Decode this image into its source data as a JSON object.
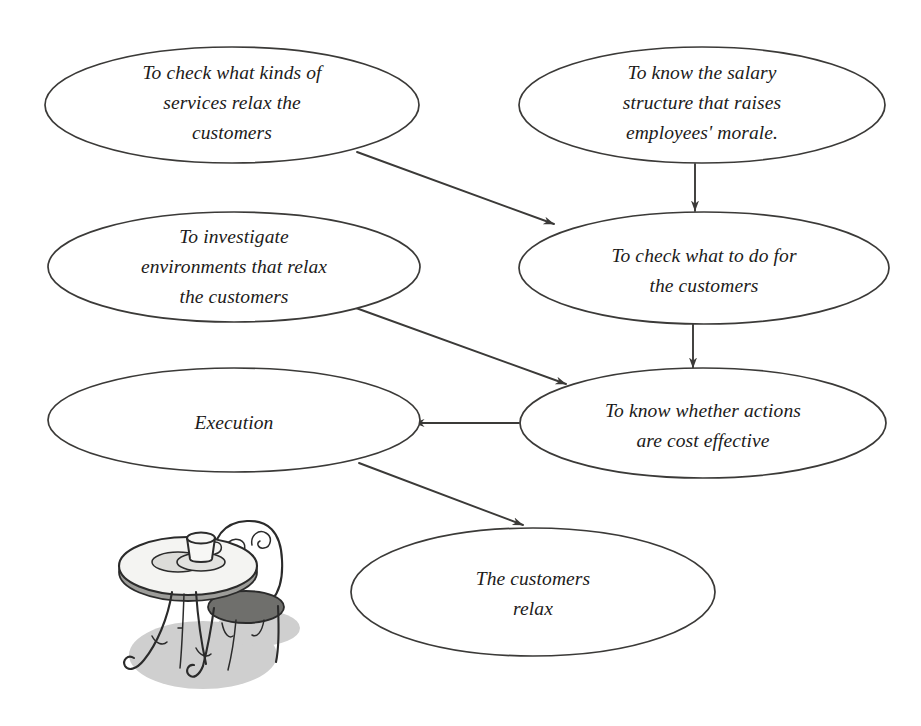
{
  "diagram": {
    "line_color": "#3b3a38",
    "node_fill": "#ffffff",
    "background": "#ffffff",
    "nodes": [
      {
        "id": "services",
        "label": "To check what kinds of services relax the customers",
        "lines": [
          "To check what kinds of",
          "services relax the",
          "customers"
        ],
        "cx": 232,
        "cy": 105,
        "rx": 187,
        "ry": 58
      },
      {
        "id": "salary",
        "label": "To know the salary structure that raises employees' morale.",
        "lines": [
          "To know the salary",
          "structure that raises",
          "employees' morale."
        ],
        "cx": 702,
        "cy": 105,
        "rx": 183,
        "ry": 58
      },
      {
        "id": "environments",
        "label": "To investigate environments that relax the customers",
        "lines": [
          "To investigate",
          "environments that relax",
          "the customers"
        ],
        "cx": 234,
        "cy": 267,
        "rx": 186,
        "ry": 55
      },
      {
        "id": "what-to-do",
        "label": "To check what to do for the customers",
        "lines": [
          "To check what to do for",
          "the customers"
        ],
        "cx": 704,
        "cy": 268,
        "rx": 185,
        "ry": 56
      },
      {
        "id": "execution",
        "label": "Execution",
        "lines": [
          "Execution"
        ],
        "cx": 234,
        "cy": 420,
        "rx": 186,
        "ry": 52
      },
      {
        "id": "cost-effective",
        "label": "To know whether actions are cost effective",
        "lines": [
          "To know whether actions",
          "are cost effective"
        ],
        "cx": 703,
        "cy": 423,
        "rx": 183,
        "ry": 55
      },
      {
        "id": "customers-relax",
        "label": "The customers relax",
        "lines": [
          "The customers",
          "relax"
        ],
        "cx": 533,
        "cy": 592,
        "rx": 182,
        "ry": 64
      }
    ],
    "edges": [
      {
        "id": "services-to-what-to-do",
        "from": "services",
        "to": "what-to-do",
        "x1": 357,
        "y1": 152,
        "x2": 554,
        "y2": 224
      },
      {
        "id": "salary-to-what-to-do",
        "from": "salary",
        "to": "what-to-do",
        "x1": 695,
        "y1": 164,
        "x2": 695,
        "y2": 211
      },
      {
        "id": "environments-to-cost-effective",
        "from": "environments",
        "to": "cost-effective",
        "x1": 356,
        "y1": 308,
        "x2": 566,
        "y2": 384
      },
      {
        "id": "what-to-do-to-cost-effective",
        "from": "what-to-do",
        "to": "cost-effective",
        "x1": 693,
        "y1": 324,
        "x2": 693,
        "y2": 368
      },
      {
        "id": "cost-effective-to-execution",
        "from": "cost-effective",
        "to": "execution",
        "x1": 519,
        "y1": 423,
        "x2": 414,
        "y2": 423
      },
      {
        "id": "execution-to-customers-relax",
        "from": "execution",
        "to": "customers-relax",
        "x1": 359,
        "y1": 463,
        "x2": 523,
        "y2": 525
      }
    ]
  },
  "illustration": {
    "name": "cafe-table-illustration",
    "description": "Round bistro table with coffee cup and saucer beside an ornate wrought-iron chair",
    "shadow_color": "#cfcfcf",
    "seat_color": "#6f6f6c",
    "bounds": {
      "x": 120,
      "y": 518,
      "width": 172,
      "height": 180
    }
  }
}
